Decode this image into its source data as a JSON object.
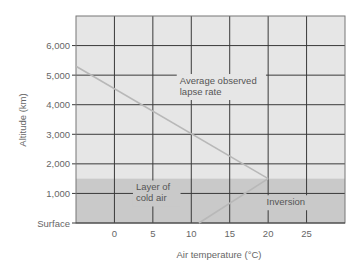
{
  "chart_data": {
    "type": "line",
    "title": "",
    "xlabel": "Air temperature (°C)",
    "ylabel": "Altitude (km)",
    "xlim": [
      -5,
      30
    ],
    "ylim": [
      0,
      7000
    ],
    "x_ticks": [
      0,
      5,
      10,
      15,
      20,
      25
    ],
    "x_tick_labels": [
      "0",
      "5",
      "10",
      "15",
      "20",
      "25"
    ],
    "y_ticks": [
      0,
      1000,
      2000,
      3000,
      4000,
      5000,
      6000
    ],
    "y_tick_labels": [
      "Surface",
      "1,000",
      "2,000",
      "3,000",
      "4,000",
      "5,000",
      "6,000"
    ],
    "grid": true,
    "shaded_regions": [
      {
        "name": "Layer of cold air",
        "y_from": 0,
        "y_to": 1500,
        "color": "#c9c9c9"
      }
    ],
    "series": [
      {
        "name": "Average observed lapse rate",
        "x": [
          -5,
          20
        ],
        "y": [
          5300,
          1500
        ],
        "color": "#b8b8b8"
      },
      {
        "name": "Inversion",
        "x": [
          11,
          20
        ],
        "y": [
          0,
          1500
        ],
        "color": "#b8b8b8"
      }
    ],
    "annotations": [
      {
        "text_lines": [
          "Average observed",
          "lapse rate"
        ],
        "x": 8.5,
        "y": 4700
      },
      {
        "text_lines": [
          "Layer of",
          "cold air"
        ],
        "x": 2.8,
        "y": 1100
      },
      {
        "text_lines": [
          "Inversion"
        ],
        "x": 19.8,
        "y": 600
      }
    ],
    "colors": {
      "plot_bg": "#e6e6e6",
      "cold_layer": "#c9c9c9",
      "grid": "#3a3a3a",
      "lines": "#b8b8b8"
    }
  }
}
